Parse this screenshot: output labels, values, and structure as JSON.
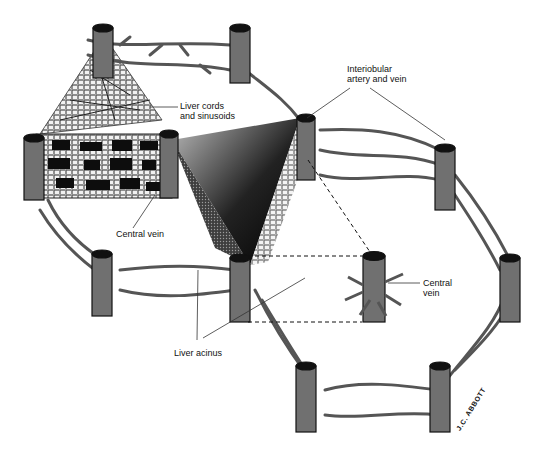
{
  "figure": {
    "colors": {
      "vessel": "#6e6e6e",
      "vessel_dark": "#1a1a1a",
      "background": "#ffffff",
      "label_line": "#333333"
    }
  },
  "labels": {
    "liver_cords": "Liver cords\nand sinusoids",
    "interlobular": "Interiobular\nartery and vein",
    "central_vein_left": "Central vein",
    "central_vein_right": "Central\nvein",
    "liver_acinus": "Liver acinus"
  },
  "signature": "J.C. ABBOTT",
  "vessels": [
    {
      "id": "top-left",
      "x": 74,
      "y": 30
    },
    {
      "id": "top-mid",
      "x": 240,
      "y": 30
    },
    {
      "id": "mid-left",
      "x": 34,
      "y": 140
    },
    {
      "id": "mid-center",
      "x": 165,
      "y": 140
    },
    {
      "id": "right-upper",
      "x": 305,
      "y": 122
    },
    {
      "id": "far-right-upper",
      "x": 445,
      "y": 150
    },
    {
      "id": "left-lower",
      "x": 102,
      "y": 255
    },
    {
      "id": "center-lower",
      "x": 240,
      "y": 260
    },
    {
      "id": "central-vein-isolated",
      "x": 375,
      "y": 260
    },
    {
      "id": "far-right-lower",
      "x": 510,
      "y": 260
    },
    {
      "id": "bottom-left",
      "x": 307,
      "y": 370
    },
    {
      "id": "bottom-right",
      "x": 440,
      "y": 370
    }
  ]
}
